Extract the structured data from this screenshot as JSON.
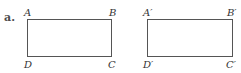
{
  "part_label": "a.",
  "figures": [
    {
      "name": "original",
      "vertices": {
        "top_left": "A",
        "top_right": "B",
        "bottom_left": "D",
        "bottom_right": "C"
      }
    },
    {
      "name": "image",
      "vertices": {
        "top_left": "A′",
        "top_right": "B′",
        "bottom_left": "D′",
        "bottom_right": "C′"
      }
    }
  ],
  "colors": {
    "stroke": "#555555",
    "text": "#333333"
  }
}
